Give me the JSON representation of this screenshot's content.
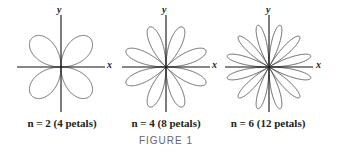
{
  "figure_label": "FIGURE 1",
  "panels": [
    {
      "n": 2,
      "petals": 4,
      "caption": "n = 2 (4 petals)",
      "cx": 61,
      "cy": 67,
      "R": 50,
      "x_label": "x",
      "y_label": "y"
    },
    {
      "n": 4,
      "petals": 8,
      "caption": "n = 4 (8 petals)",
      "cx": 166,
      "cy": 67,
      "R": 48,
      "x_label": "x",
      "y_label": "y"
    },
    {
      "n": 6,
      "petals": 12,
      "caption": "n = 6 (12 petals)",
      "cx": 269,
      "cy": 67,
      "R": 48,
      "x_label": "x",
      "y_label": "y"
    }
  ],
  "colors": {
    "curve": "#555555",
    "axis": "#111111",
    "text": "#222222",
    "figure_label": "#666666"
  }
}
